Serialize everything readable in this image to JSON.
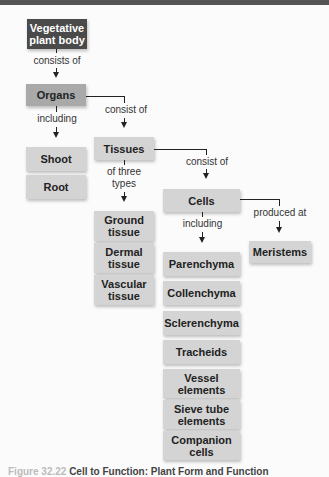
{
  "nodes": {
    "vegetative": "Vegetative plant body",
    "organs": "Organs",
    "shoot": "Shoot",
    "root": "Root",
    "tissues": "Tissues",
    "ground": "Ground tissue",
    "dermal": "Dermal tissue",
    "vascular": "Vascular tissue",
    "cells": "Cells",
    "meristems": "Meristems",
    "parenchyma": "Parenchyma",
    "collenchyma": "Collenchyma",
    "sclerenchyma": "Sclerenchyma",
    "tracheids": "Tracheids",
    "vessel": "Vessel elements",
    "sieve": "Sieve tube elements",
    "companion": "Companion cells"
  },
  "edges": {
    "consists_of": "consists of",
    "including_1": "including",
    "consist_of_1": "consist of",
    "of_three_types": "of three types",
    "consist_of_2": "consist of",
    "including_2": "including",
    "produced_at": "produced at"
  },
  "caption": {
    "figure": "Figure 32.22",
    "title": "Cell to Function: Plant Form and Function"
  },
  "colors": {
    "dark_box": "#4a4a4a",
    "mid_box": "#a9a9a9",
    "light_box": "#dcdcdc",
    "topbar": "#555555"
  }
}
